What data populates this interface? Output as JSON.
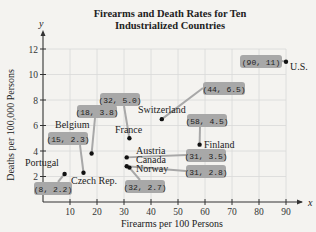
{
  "chart_data": {
    "type": "scatter",
    "title": "Firearms and Death Rates for Ten Industrialized Countries",
    "title_lines": [
      "Firearms and Death Rates for Ten",
      "Industrialized Countries"
    ],
    "xlabel": "Firearms per 100 Persons",
    "ylabel": "Deaths per 100,000 Persons",
    "x_axis_letter": "x",
    "y_axis_letter": "y",
    "xlim": [
      0,
      95
    ],
    "ylim": [
      0,
      12.5
    ],
    "xticks": [
      10,
      20,
      30,
      40,
      50,
      60,
      70,
      80,
      90
    ],
    "yticks": [
      2,
      4,
      6,
      8,
      10,
      12
    ],
    "grid": true,
    "points": [
      {
        "country": "U.S.",
        "x": 90,
        "y": 11,
        "label": "(90, 11)"
      },
      {
        "country": "Switzerland",
        "x": 44,
        "y": 6.5,
        "label": "(44, 6.5)"
      },
      {
        "country": "Finland",
        "x": 58,
        "y": 4.5,
        "label": "(58, 4.5)"
      },
      {
        "country": "France",
        "x": 32,
        "y": 5.0,
        "label": "(32, 5.0)"
      },
      {
        "country": "Belgium",
        "x": 18,
        "y": 3.8,
        "label": "(18, 3.8)"
      },
      {
        "country": "Austria",
        "x": 31,
        "y": 3.5,
        "label": "(31, 3.5)"
      },
      {
        "country": "Canada",
        "x": 31,
        "y": 2.8,
        "label": "(31, 2.8)"
      },
      {
        "country": "Norway",
        "x": 32,
        "y": 2.7,
        "label": "(32, 2.7)"
      },
      {
        "country": "Czech Rep.",
        "x": 15,
        "y": 2.3,
        "label": "(15, 2.3)"
      },
      {
        "country": "Portugal",
        "x": 8,
        "y": 2.2,
        "label": "(8, 2.2)"
      }
    ]
  },
  "colors": {
    "background": "#f4f3f0",
    "grid": "#d8d8d8",
    "axis": "#333333",
    "callout": "#a8a8a8",
    "point": "#111111"
  }
}
